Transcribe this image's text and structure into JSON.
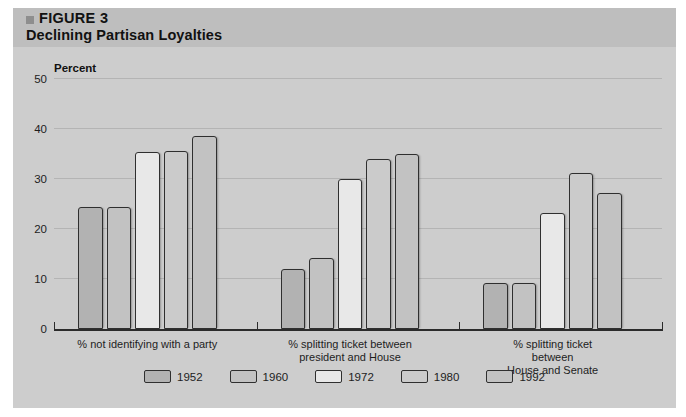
{
  "figure": {
    "bullet_icon": "square-bullet-icon",
    "number": "FIGURE 3",
    "title": "Declining Partisan Loyalties"
  },
  "colors": {
    "page_background": "#ffffff",
    "figure_background": "#cdcdcd",
    "header_band": "#bebebe",
    "gridline": "#b4b4b4",
    "axis": "#2b2b2b",
    "bar_outline": "#2f2f2f",
    "series_1952": "#b2b2b2",
    "series_1960": "#c2c2c2",
    "series_1972": "#e8e8e8",
    "series_1980": "#cbcbcb",
    "series_1992": "#c2c2c2"
  },
  "chart_data": {
    "type": "bar",
    "title": "Declining Partisan Loyalties",
    "subtitle": "FIGURE 3",
    "xlabel": "",
    "ylabel": "Percent",
    "ylim": [
      0,
      50
    ],
    "yticks": [
      0,
      10,
      20,
      30,
      40,
      50
    ],
    "ytick_labels": [
      "0",
      "10",
      "20",
      "30",
      "40",
      "50"
    ],
    "grid": true,
    "legend_position": "bottom",
    "categories": [
      "% not identifying with a party",
      "% splitting ticket between\npresident and House",
      "% splitting ticket between\nHouse and Senate"
    ],
    "series": [
      {
        "name": "1952",
        "color": "#b2b2b2",
        "values": [
          24.5,
          12.0,
          9.3
        ]
      },
      {
        "name": "1960",
        "color": "#c2c2c2",
        "values": [
          24.5,
          14.2,
          9.3
        ]
      },
      {
        "name": "1972",
        "color": "#e8e8e8",
        "values": [
          35.5,
          30.0,
          23.3
        ]
      },
      {
        "name": "1980",
        "color": "#cbcbcb",
        "values": [
          35.7,
          34.0,
          31.2
        ]
      },
      {
        "name": "1992",
        "color": "#c2c2c2",
        "values": [
          38.6,
          35.0,
          27.2
        ]
      }
    ]
  }
}
